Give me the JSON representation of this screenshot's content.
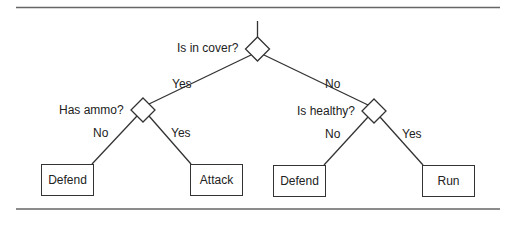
{
  "diagram": {
    "type": "decision-tree",
    "root": {
      "question": "Is in cover?",
      "yes_label": "Yes",
      "no_label": "No"
    },
    "left_decision": {
      "question": "Has ammo?",
      "no_label": "No",
      "yes_label": "Yes"
    },
    "right_decision": {
      "question": "Is healthy?",
      "no_label": "No",
      "yes_label": "Yes"
    },
    "leaves": [
      {
        "label": "Defend"
      },
      {
        "label": "Attack"
      },
      {
        "label": "Defend"
      },
      {
        "label": "Run"
      }
    ],
    "colors": {
      "line": "#333333",
      "background": "#ffffff"
    }
  }
}
